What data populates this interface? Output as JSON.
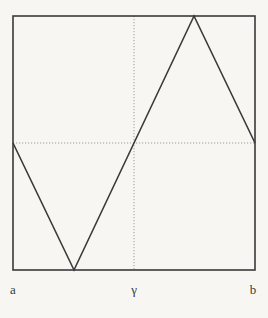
{
  "figure": {
    "background_color": "#f7f6f2",
    "line_color": "#3a3a3a",
    "dotted_line_color": "#9b9b97",
    "canvas": {
      "width": 268,
      "height": 318
    },
    "frame": {
      "x": 13,
      "y": 16,
      "width": 242,
      "height": 254
    },
    "horizontal_midline": {
      "y": 143,
      "x1": 13,
      "x2": 255
    },
    "vertical_gamma_line": {
      "x": 134,
      "y1": 16,
      "y2": 270
    },
    "curve_points": [
      [
        13,
        143
      ],
      [
        74,
        270
      ],
      [
        194,
        16
      ],
      [
        255,
        143
      ]
    ],
    "labels": {
      "a": {
        "text": "a",
        "x": 13,
        "y": 294
      },
      "gamma": {
        "text": "γ",
        "x": 134,
        "y": 294
      },
      "b": {
        "text": "b",
        "x": 253,
        "y": 294
      }
    }
  },
  "chart_data": {
    "type": "line",
    "title": "",
    "xlabel": "",
    "ylabel": "",
    "x_tick_labels": [
      "a",
      "γ",
      "b"
    ],
    "x_tick_positions_normalized": [
      0,
      0.5,
      1
    ],
    "series": [
      {
        "name": "f",
        "x_normalized": [
          0,
          0.25,
          0.75,
          1
        ],
        "y_normalized": [
          0,
          -1,
          1,
          0
        ]
      }
    ],
    "reference_lines": [
      {
        "kind": "horizontal-dotted",
        "y_normalized": 0
      },
      {
        "kind": "vertical-dotted",
        "x_normalized": 0.5,
        "label": "γ"
      }
    ],
    "xlim_normalized": [
      0,
      1
    ],
    "ylim_normalized": [
      -1,
      1
    ],
    "grid": false,
    "legend": false
  }
}
